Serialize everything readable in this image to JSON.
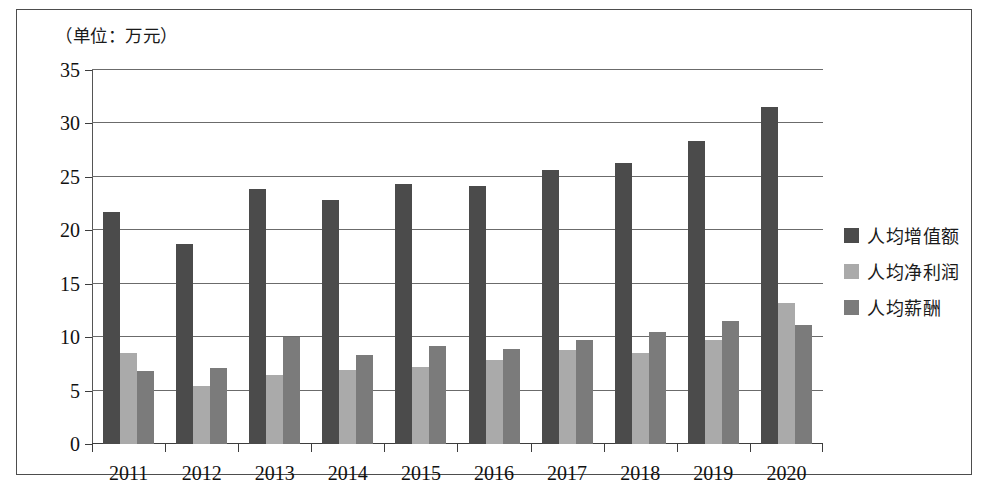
{
  "figure": {
    "unit_note": "（单位：万元）",
    "border_color": "#4d4d4d"
  },
  "legend": {
    "position": "right",
    "items": [
      {
        "label": "人均增值额",
        "color": "#4b4b4b"
      },
      {
        "label": "人均净利润",
        "color": "#aaaaaa"
      },
      {
        "label": "人均薪酬",
        "color": "#7b7b7b"
      }
    ]
  },
  "chart_data": {
    "type": "bar",
    "title": "",
    "subtitle": "",
    "annotations": [
      "（单位：万元）"
    ],
    "xlabel": "",
    "ylabel": "",
    "unit": "万元",
    "ylim": [
      0,
      35
    ],
    "ytick_labels": [
      "0",
      "5",
      "10",
      "15",
      "20",
      "25",
      "30",
      "35"
    ],
    "yticks": [
      0,
      5,
      10,
      15,
      20,
      25,
      30,
      35
    ],
    "grid": true,
    "legend_position": "right",
    "categories": [
      "2011",
      "2012",
      "2013",
      "2014",
      "2015",
      "2016",
      "2017",
      "2018",
      "2019",
      "2020"
    ],
    "series": [
      {
        "name": "人均增值额",
        "color": "#4b4b4b",
        "values": [
          21.7,
          18.7,
          23.9,
          22.8,
          24.3,
          24.1,
          25.6,
          26.3,
          28.4,
          31.5
        ]
      },
      {
        "name": "人均净利润",
        "color": "#aaaaaa",
        "values": [
          8.5,
          5.4,
          6.5,
          6.9,
          7.2,
          7.9,
          8.8,
          8.5,
          9.7,
          13.2
        ]
      },
      {
        "name": "人均薪酬",
        "color": "#7b7b7b",
        "values": [
          6.8,
          7.1,
          10.0,
          8.3,
          9.2,
          8.9,
          9.7,
          10.5,
          11.5,
          11.1
        ]
      }
    ]
  }
}
